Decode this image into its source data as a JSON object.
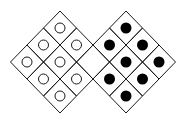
{
  "diagram": {
    "stroke_color": "#1a1a1a",
    "fill_color": "#000000",
    "background": "#ffffff",
    "cell_half_width": 16.5,
    "cell_half_height": 17,
    "circle_radius": 5,
    "dot_radius": 5.5,
    "left_grid": {
      "top": [
        60,
        11
      ],
      "marker": "open-circle",
      "cells": [
        {
          "cx": 60,
          "cy": 28,
          "mark": "open"
        },
        {
          "cx": 43.5,
          "cy": 45,
          "mark": "open"
        },
        {
          "cx": 76.5,
          "cy": 45,
          "mark": "open"
        },
        {
          "cx": 27,
          "cy": 62,
          "mark": "open"
        },
        {
          "cx": 60,
          "cy": 62,
          "mark": "open"
        },
        {
          "cx": 93,
          "cy": 62,
          "mark": "empty"
        },
        {
          "cx": 43.5,
          "cy": 79,
          "mark": "open"
        },
        {
          "cx": 76.5,
          "cy": 79,
          "mark": "open"
        },
        {
          "cx": 60,
          "cy": 96,
          "mark": "open"
        }
      ]
    },
    "right_grid": {
      "top": [
        126,
        11
      ],
      "marker": "filled-dot",
      "cells": [
        {
          "cx": 126,
          "cy": 28,
          "mark": "filled"
        },
        {
          "cx": 109.5,
          "cy": 45,
          "mark": "filled"
        },
        {
          "cx": 142.5,
          "cy": 45,
          "mark": "filled"
        },
        {
          "cx": 93,
          "cy": 62,
          "mark": "empty"
        },
        {
          "cx": 126,
          "cy": 62,
          "mark": "filled"
        },
        {
          "cx": 159,
          "cy": 62,
          "mark": "filled"
        },
        {
          "cx": 109.5,
          "cy": 79,
          "mark": "filled"
        },
        {
          "cx": 142.5,
          "cy": 79,
          "mark": "filled"
        },
        {
          "cx": 126,
          "cy": 96,
          "mark": "filled"
        }
      ]
    },
    "counts": {
      "open_circles": 8,
      "filled_dots": 8,
      "empty_cells": 1
    }
  }
}
